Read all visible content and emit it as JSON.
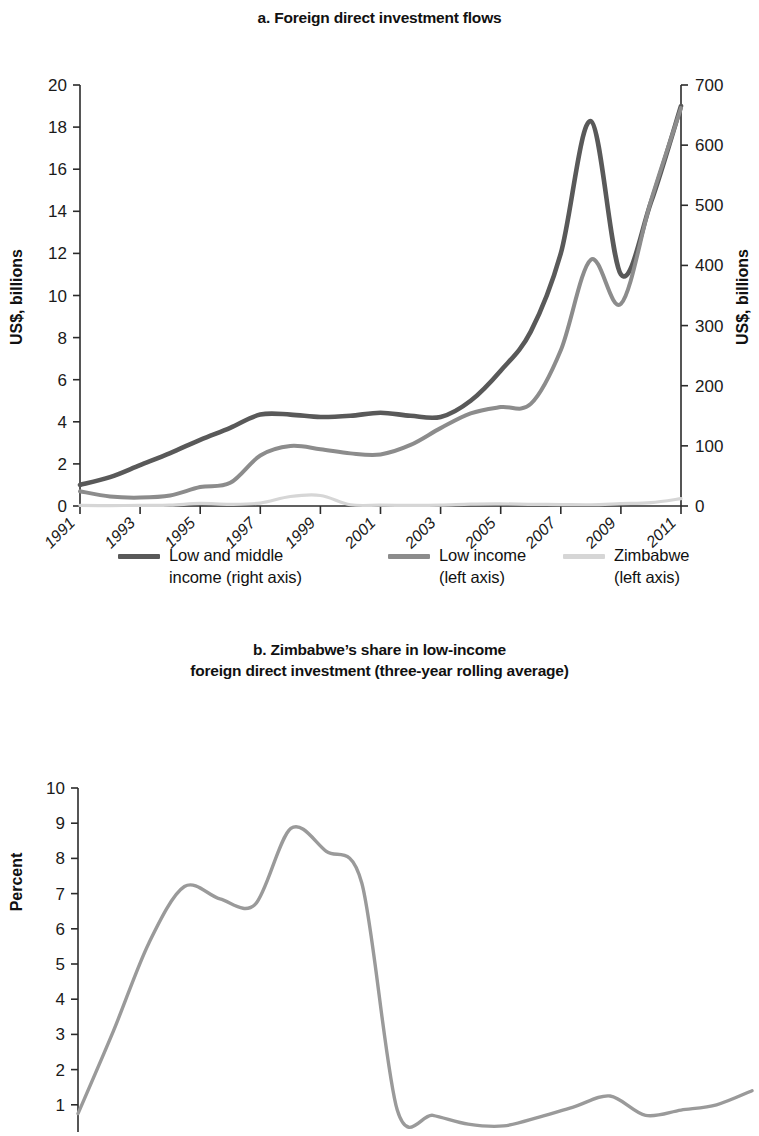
{
  "panel_a": {
    "title": "a. Foreign direct investment flows",
    "y_left_title": "US$, billions",
    "y_right_title": "US$, billions",
    "legend": [
      {
        "label_line1": "Low and middle",
        "label_line2": "income (right axis)",
        "color": "#595959"
      },
      {
        "label_line1": "Low income",
        "label_line2": "(left axis)",
        "color": "#8c8c8c"
      },
      {
        "label_line1": "Zimbabwe",
        "label_line2": "(left axis)",
        "color": "#d6d6d6"
      }
    ]
  },
  "panel_b": {
    "title_line1": "b. Zimbabwe’s share in low-income",
    "title_line2": "foreign direct investment (three-year rolling average)",
    "y_title": "Percent"
  },
  "chart_data": [
    {
      "type": "line",
      "title": "a. Foreign direct investment flows",
      "xlabel": "",
      "ylabel": "US$, billions",
      "y2label": "US$, billions",
      "ylim": [
        0,
        20
      ],
      "y2lim": [
        0,
        700
      ],
      "yticks": [
        0,
        2,
        4,
        6,
        8,
        10,
        12,
        14,
        16,
        18,
        20
      ],
      "y2ticks": [
        0,
        100,
        200,
        300,
        400,
        500,
        600,
        700
      ],
      "xticks": [
        "1991",
        "1993",
        "1995",
        "1997",
        "1999",
        "2001",
        "2003",
        "2005",
        "2007",
        "2009",
        "2011"
      ],
      "x": [
        1991,
        1992,
        1993,
        1994,
        1995,
        1996,
        1997,
        1998,
        1999,
        2000,
        2001,
        2002,
        2003,
        2004,
        2005,
        2006,
        2007,
        2008,
        2009,
        2010,
        2011
      ],
      "grid": false,
      "legend_position": "bottom",
      "series": [
        {
          "name": "Low and middle income (right axis)",
          "axis": "right",
          "units": "US$, billions",
          "color": "#595959",
          "values": [
            35,
            48,
            68,
            88,
            110,
            130,
            152,
            152,
            148,
            150,
            155,
            150,
            148,
            175,
            225,
            290,
            420,
            640,
            385,
            505,
            665
          ]
        },
        {
          "name": "Low income (left axis)",
          "axis": "left",
          "units": "US$, billions",
          "color": "#8c8c8c",
          "values": [
            0.7,
            0.45,
            0.4,
            0.5,
            0.9,
            1.1,
            2.4,
            2.85,
            2.7,
            2.5,
            2.45,
            2.9,
            3.7,
            4.4,
            4.7,
            4.85,
            7.4,
            11.7,
            9.6,
            14.5,
            18.9
          ]
        },
        {
          "name": "Zimbabwe (left axis)",
          "axis": "left",
          "units": "US$, billions",
          "color": "#d6d6d6",
          "values": [
            0.03,
            0.02,
            0.03,
            0.04,
            0.12,
            0.08,
            0.14,
            0.45,
            0.5,
            0.06,
            0.04,
            0.03,
            0.04,
            0.09,
            0.1,
            0.08,
            0.07,
            0.06,
            0.11,
            0.16,
            0.35
          ]
        }
      ]
    },
    {
      "type": "line",
      "title": "b. Zimbabwe’s share in low-income foreign direct investment (three-year rolling average)",
      "xlabel": "",
      "ylabel": "Percent",
      "ylim": [
        0,
        10
      ],
      "yticks": [
        0,
        1,
        2,
        3,
        4,
        5,
        6,
        7,
        8,
        9,
        10
      ],
      "xticks": [
        "1992",
        "1993",
        "1994",
        "1995",
        "1996",
        "1997",
        "1998",
        "1999",
        "2000",
        "2001",
        "2002",
        "2003",
        "2004",
        "2005",
        "2006",
        "2007",
        "2008",
        "2009",
        "2010",
        "2011"
      ],
      "x": [
        1992,
        1993,
        1994,
        1995,
        1996,
        1997,
        1998,
        1999,
        2000,
        2001,
        2002,
        2003,
        2004,
        2005,
        2006,
        2007,
        2008,
        2009,
        2010,
        2011
      ],
      "grid": false,
      "legend_position": "none",
      "series": [
        {
          "name": "Zimbabwe share of low-income FDI",
          "color": "#9a9a9a",
          "values": [
            0.75,
            3.1,
            5.6,
            7.2,
            6.85,
            6.7,
            8.85,
            8.2,
            7.3,
            0.85,
            0.7,
            0.45,
            0.4,
            0.65,
            0.95,
            1.25,
            0.7,
            0.85,
            1.0,
            1.4
          ]
        }
      ]
    }
  ]
}
